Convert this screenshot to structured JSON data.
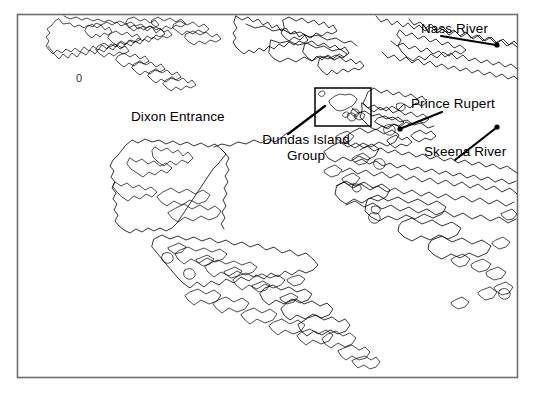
{
  "figure": {
    "type": "map",
    "region": "Dixon Entrance / Northern British Columbia coast",
    "frame_color": "#6f6f6f",
    "coastline_color": "#000000",
    "background_color": "#ffffff"
  },
  "labels": {
    "dixon_entrance": "Dixon Entrance",
    "nass_river": "Nass River",
    "prince_rupert": "Prince Rupert",
    "skeena_river": "Skeena River",
    "dundas_island_group_line1": "Dundas Island",
    "dundas_island_group_line2": "Group",
    "zero_marker": "0"
  },
  "annotations": [
    {
      "name": "nass-river",
      "label": "Nass River",
      "leader_from": [
        441,
        36
      ],
      "leader_to": [
        497,
        45
      ],
      "marker": [
        497,
        45
      ]
    },
    {
      "name": "prince-rupert",
      "label": "Prince Rupert",
      "leader_from": [
        440,
        113
      ],
      "leader_to": [
        400,
        128
      ],
      "marker": [
        400,
        129
      ]
    },
    {
      "name": "skeena-river",
      "label": "Skeena River",
      "leader_from": [
        455,
        160
      ],
      "leader_to": [
        497,
        127
      ],
      "marker": [
        497,
        127
      ]
    },
    {
      "name": "dundas-island-group",
      "label": "Dundas Island Group",
      "leader_from": [
        289,
        133
      ],
      "leader_to": [
        324,
        105
      ],
      "inset_box": [
        315,
        88,
        56,
        38
      ]
    }
  ],
  "inset": {
    "name": "dundas-island-inset",
    "x": 315,
    "y": 88,
    "width": 56,
    "height": 38,
    "contents": "Dundas Island plus small islets"
  }
}
